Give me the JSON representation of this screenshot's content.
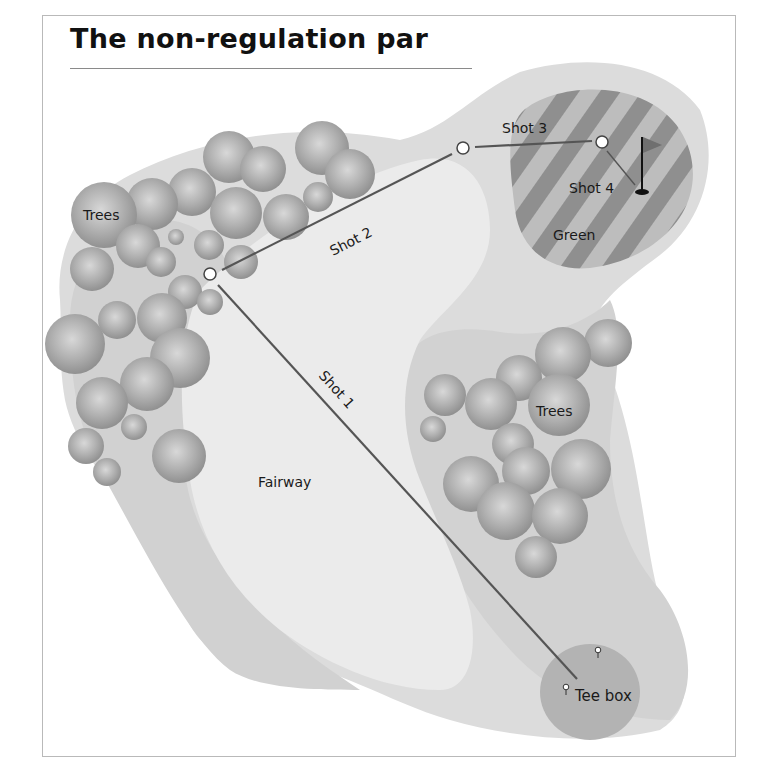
{
  "title": "The non-regulation par",
  "labels": {
    "trees_left": "Trees",
    "trees_right": "Trees",
    "fairway": "Fairway",
    "green": "Green",
    "tee_box": "Tee box",
    "shot1": "Shot 1",
    "shot2": "Shot 2",
    "shot3": "Shot 3",
    "shot4": "Shot 4"
  },
  "colors": {
    "rough": "#dcdcdc",
    "rough_dark": "#d0d0d0",
    "fairway": "#ebebeb",
    "green_dark": "#8f8f8f",
    "green_light": "#bdbdbd",
    "tee_box": "#b3b3b3",
    "shot_line": "#555555",
    "tree": "#a8a8a8"
  },
  "icons": {
    "flag": "flag-icon",
    "ball_marker": "ball-marker-icon",
    "tee_marker": "tee-marker-icon",
    "tree": "tree-icon"
  }
}
